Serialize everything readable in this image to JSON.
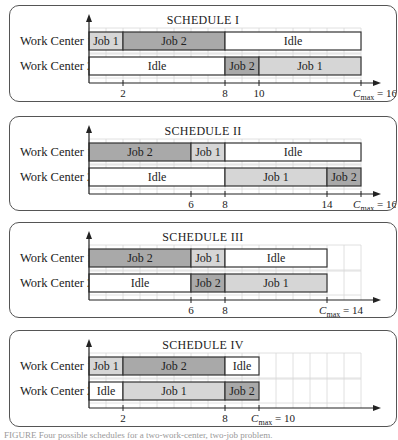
{
  "figure": {
    "unit_px": 17,
    "origin_x": 79,
    "colors": {
      "job1": "#d6d6d6",
      "job2": "#a9a9a9",
      "idle": "#ffffff",
      "grid": "#d8d8d8",
      "border": "#333333"
    }
  },
  "row_labels": [
    "Work Center 1",
    "Work Center 2"
  ],
  "schedules": [
    {
      "title": "SCHEDULE I",
      "top": 5,
      "height": 97,
      "grid_units": 16,
      "cmax": 16,
      "ticks": [
        2,
        8,
        10
      ],
      "cmax_label": "= 16",
      "rows": [
        [
          {
            "label": "Job 1",
            "start": 0,
            "end": 2,
            "type": "job1"
          },
          {
            "label": "Job 2",
            "start": 2,
            "end": 8,
            "type": "job2"
          },
          {
            "label": "Idle",
            "start": 8,
            "end": 16,
            "type": "idle"
          }
        ],
        [
          {
            "label": "Idle",
            "start": 0,
            "end": 8,
            "type": "idle"
          },
          {
            "label": "Job 2",
            "start": 8,
            "end": 10,
            "type": "job2"
          },
          {
            "label": "Job 1",
            "start": 10,
            "end": 16,
            "type": "job1"
          }
        ]
      ]
    },
    {
      "title": "SCHEDULE II",
      "top": 116,
      "height": 95,
      "grid_units": 16,
      "cmax": 16,
      "ticks": [
        6,
        8,
        14
      ],
      "cmax_label": "= 16",
      "rows": [
        [
          {
            "label": "Job 2",
            "start": 0,
            "end": 6,
            "type": "job2"
          },
          {
            "label": "Job 1",
            "start": 6,
            "end": 8,
            "type": "job1"
          },
          {
            "label": "Idle",
            "start": 8,
            "end": 16,
            "type": "idle"
          }
        ],
        [
          {
            "label": "Idle",
            "start": 0,
            "end": 8,
            "type": "idle"
          },
          {
            "label": "Job 1",
            "start": 8,
            "end": 14,
            "type": "job1"
          },
          {
            "label": "Job 2",
            "start": 14,
            "end": 16,
            "type": "job2"
          }
        ]
      ]
    },
    {
      "title": "SCHEDULE III",
      "top": 222,
      "height": 96,
      "grid_units": 16,
      "cmax": 14,
      "ticks": [
        6,
        8
      ],
      "cmax_label": "= 14",
      "rows": [
        [
          {
            "label": "Job 2",
            "start": 0,
            "end": 6,
            "type": "job2"
          },
          {
            "label": "Job 1",
            "start": 6,
            "end": 8,
            "type": "job1"
          },
          {
            "label": "Idle",
            "start": 8,
            "end": 14,
            "type": "idle"
          }
        ],
        [
          {
            "label": "Idle",
            "start": 0,
            "end": 6,
            "type": "idle"
          },
          {
            "label": "Job 2",
            "start": 6,
            "end": 8,
            "type": "job2"
          },
          {
            "label": "Job 1",
            "start": 8,
            "end": 14,
            "type": "job1"
          }
        ]
      ]
    },
    {
      "title": "SCHEDULE IV",
      "top": 330,
      "height": 97,
      "grid_units": 16,
      "cmax": 10,
      "ticks": [
        2,
        8
      ],
      "cmax_label": "= 10",
      "rows": [
        [
          {
            "label": "Job 1",
            "start": 0,
            "end": 2,
            "type": "job1"
          },
          {
            "label": "Job 2",
            "start": 2,
            "end": 8,
            "type": "job2"
          },
          {
            "label": "Idle",
            "start": 8,
            "end": 10,
            "type": "idle"
          }
        ],
        [
          {
            "label": "Idle",
            "start": 0,
            "end": 2,
            "type": "idle"
          },
          {
            "label": "Job 1",
            "start": 2,
            "end": 8,
            "type": "job1"
          },
          {
            "label": "Job 2",
            "start": 8,
            "end": 10,
            "type": "job2"
          }
        ]
      ]
    }
  ],
  "cmax_symbol": "C",
  "cmax_sub": "max",
  "caption": "FIGURE  Four possible schedules for a two-work-center, two-job problem."
}
